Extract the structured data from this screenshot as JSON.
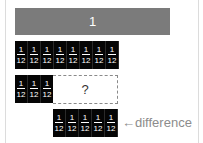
{
  "diagram": {
    "whole_bar": {
      "label": "1",
      "color": "#7b7b7b"
    },
    "row_twelve": {
      "count": 8,
      "tiles": [
        {
          "num": "1",
          "den": "12"
        },
        {
          "num": "1",
          "den": "12"
        },
        {
          "num": "1",
          "den": "12"
        },
        {
          "num": "1",
          "den": "12"
        },
        {
          "num": "1",
          "den": "12"
        },
        {
          "num": "1",
          "den": "12"
        },
        {
          "num": "1",
          "den": "12"
        },
        {
          "num": "1",
          "den": "12"
        }
      ]
    },
    "row_subtract": {
      "tiles": [
        {
          "num": "1",
          "den": "12"
        },
        {
          "num": "1",
          "den": "12"
        },
        {
          "num": "1",
          "den": "12"
        }
      ],
      "unknown_label": "?"
    },
    "row_difference": {
      "tiles": [
        {
          "num": "1",
          "den": "12"
        },
        {
          "num": "1",
          "den": "12"
        },
        {
          "num": "1",
          "den": "12"
        },
        {
          "num": "1",
          "den": "12"
        },
        {
          "num": "1",
          "den": "12"
        }
      ],
      "label": "←difference"
    },
    "tile_color": "#050505"
  }
}
